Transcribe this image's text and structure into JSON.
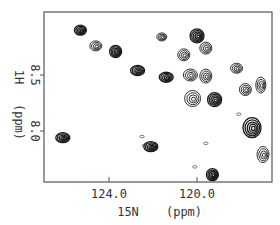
{
  "chart_data": {
    "type": "scatter",
    "subtype": "2D NMR HSQC contour spectrum",
    "title": "",
    "xlabel": "15N  (ppm)",
    "ylabel": "1H  (ppm)",
    "x_axis": {
      "reversed": true,
      "ticks": [
        124.0,
        120.0
      ],
      "tick_labels": [
        "124.0",
        "120.0"
      ],
      "range": [
        126.9,
        116.5
      ]
    },
    "y_axis": {
      "reversed": true,
      "ticks": [
        8.5,
        8.0
      ],
      "tick_labels": [
        "8.5",
        "8.0"
      ],
      "range": [
        9.06,
        7.54
      ]
    },
    "grid": false,
    "legend": null,
    "peaks": [
      {
        "x": 125.3,
        "y": 8.9,
        "rx": 6,
        "ry": 5,
        "intensity": "strong"
      },
      {
        "x": 124.6,
        "y": 8.76,
        "rx": 6,
        "ry": 5,
        "intensity": "medium"
      },
      {
        "x": 123.7,
        "y": 8.71,
        "rx": 6,
        "ry": 6,
        "intensity": "strong"
      },
      {
        "x": 122.7,
        "y": 8.54,
        "rx": 7,
        "ry": 5,
        "intensity": "strong"
      },
      {
        "x": 121.6,
        "y": 8.84,
        "rx": 5,
        "ry": 4,
        "intensity": "medium"
      },
      {
        "x": 120.0,
        "y": 8.85,
        "rx": 7,
        "ry": 7,
        "intensity": "strong"
      },
      {
        "x": 120.6,
        "y": 8.68,
        "rx": 6,
        "ry": 6,
        "intensity": "medium"
      },
      {
        "x": 119.6,
        "y": 8.74,
        "rx": 6,
        "ry": 6,
        "intensity": "medium"
      },
      {
        "x": 121.4,
        "y": 8.48,
        "rx": 7,
        "ry": 5,
        "intensity": "strong"
      },
      {
        "x": 120.3,
        "y": 8.5,
        "rx": 7,
        "ry": 6,
        "intensity": "medium"
      },
      {
        "x": 119.6,
        "y": 8.49,
        "rx": 6,
        "ry": 7,
        "intensity": "medium"
      },
      {
        "x": 118.2,
        "y": 8.56,
        "rx": 6,
        "ry": 5,
        "intensity": "medium"
      },
      {
        "x": 117.8,
        "y": 8.37,
        "rx": 6,
        "ry": 6,
        "intensity": "medium"
      },
      {
        "x": 119.2,
        "y": 8.28,
        "rx": 7,
        "ry": 7,
        "intensity": "strong"
      },
      {
        "x": 120.2,
        "y": 8.29,
        "rx": 8,
        "ry": 8,
        "intensity": "medium"
      },
      {
        "x": 117.1,
        "y": 8.41,
        "rx": 5,
        "ry": 8,
        "intensity": "medium"
      },
      {
        "x": 117.5,
        "y": 8.03,
        "rx": 9,
        "ry": 10,
        "intensity": "strong"
      },
      {
        "x": 117.0,
        "y": 7.79,
        "rx": 6,
        "ry": 8,
        "intensity": "medium"
      },
      {
        "x": 126.1,
        "y": 7.94,
        "rx": 7,
        "ry": 5,
        "intensity": "strong"
      },
      {
        "x": 122.1,
        "y": 7.86,
        "rx": 7,
        "ry": 5,
        "intensity": "strong"
      },
      {
        "x": 119.3,
        "y": 7.61,
        "rx": 6,
        "ry": 6,
        "intensity": "strong"
      }
    ],
    "minor_peaks": [
      {
        "x": 122.5,
        "y": 7.95
      },
      {
        "x": 122.4,
        "y": 7.87
      },
      {
        "x": 120.1,
        "y": 7.68
      },
      {
        "x": 119.6,
        "y": 7.89
      },
      {
        "x": 118.1,
        "y": 8.15
      }
    ],
    "colors": {
      "contour": "#1a1a1a",
      "frame": "#555555",
      "background": "#ffffff"
    }
  },
  "labels": {
    "x_tick_1": "124.0",
    "x_tick_2": "120.0",
    "x_title_1": "15N",
    "x_title_2": "(ppm)",
    "y_tick_1": "8.5",
    "y_tick_2": "8.0",
    "y_title_1": "1H",
    "y_title_2": "(ppm)"
  }
}
